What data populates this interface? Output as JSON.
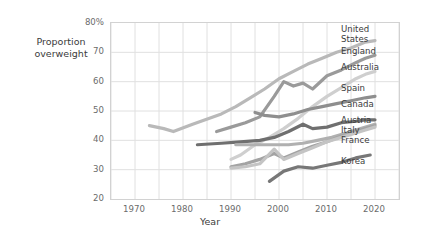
{
  "chart_data": {
    "type": "line",
    "title": "",
    "xlabel": "Year",
    "ylabel": "Proportion\noverweight",
    "xlim": [
      1965,
      2025
    ],
    "ylim": [
      20,
      80
    ],
    "xticks": [
      1970,
      1980,
      1990,
      2000,
      2010,
      2020
    ],
    "xtick_labels": [
      "1970",
      "1980",
      "1990",
      "2000",
      "2010",
      "2020"
    ],
    "yticks": [
      20,
      30,
      40,
      50,
      60,
      70,
      80
    ],
    "ytick_labels": [
      "20",
      "30",
      "40",
      "50",
      "60",
      "70",
      "80%"
    ],
    "grid": true,
    "grid_x_step": 5,
    "grid_y_step": 10,
    "legend_position": "right-inline",
    "series": [
      {
        "name": "United States",
        "label": "United\nStates",
        "color": "#b9b9b9",
        "x": [
          1973,
          1976,
          1978,
          1982,
          1988,
          1991,
          1994,
          1997,
          2000,
          2003,
          2006,
          2009,
          2012,
          2015,
          2018,
          2020
        ],
        "values": [
          45,
          44,
          43,
          45.5,
          49,
          51.5,
          54.5,
          57.5,
          61,
          63.5,
          66,
          68,
          70,
          71.5,
          73.5,
          74
        ]
      },
      {
        "name": "England",
        "label": "England",
        "color": "#9a9a9a",
        "x": [
          1987,
          1990,
          1993,
          1996,
          1999,
          2001,
          2003,
          2005,
          2007,
          2010,
          2013,
          2016,
          2018,
          2020
        ],
        "values": [
          43,
          44.5,
          46,
          48,
          55,
          60,
          58.5,
          59.5,
          57.5,
          62,
          64,
          66.5,
          68,
          69
        ]
      },
      {
        "name": "Australia",
        "label": "Australia",
        "color": "#cfcfcf",
        "x": [
          1990,
          1992,
          1995,
          1998,
          2001,
          2004,
          2007,
          2010,
          2013,
          2016,
          2018,
          2020
        ],
        "values": [
          33.5,
          35,
          38.5,
          41,
          44,
          47.5,
          51.5,
          55,
          58,
          61,
          62.5,
          63.5
        ]
      },
      {
        "name": "Spain",
        "label": "Spain",
        "color": "#8e8e8e",
        "x": [
          1995,
          1997,
          2000,
          2003,
          2006,
          2009,
          2012,
          2015,
          2018,
          2020
        ],
        "values": [
          49.5,
          48.5,
          48,
          49,
          50.5,
          51.5,
          52.5,
          53.5,
          54.5,
          55
        ]
      },
      {
        "name": "Canada",
        "label": "Canada",
        "color": "#6f6f6f",
        "x": [
          1983,
          1988,
          1992,
          1996,
          1999,
          2002,
          2005,
          2007,
          2010,
          2013,
          2016,
          2018,
          2020
        ],
        "values": [
          38.5,
          39,
          39.5,
          40,
          41,
          43,
          45.5,
          44,
          44.5,
          46,
          46.5,
          47,
          47
        ]
      },
      {
        "name": "Austria",
        "label": "Austria",
        "color": "#b0b0b0",
        "x": [
          1991,
          1994,
          1997,
          1999,
          2002,
          2005,
          2008,
          2011,
          2014,
          2017,
          2020
        ],
        "values": [
          38.5,
          38.5,
          38.5,
          38.5,
          38.5,
          39,
          40,
          41,
          42.5,
          44,
          45.5
        ]
      },
      {
        "name": "Italy",
        "label": "Italy",
        "color": "#a3a3a3",
        "x": [
          1990,
          1993,
          1996,
          1999,
          2001,
          2004,
          2007,
          2010,
          2013,
          2016,
          2018,
          2020
        ],
        "values": [
          31,
          32,
          33.5,
          35.5,
          34,
          36,
          38,
          39.5,
          41.5,
          43,
          44,
          45
        ]
      },
      {
        "name": "France",
        "label": "France",
        "color": "#c4c4c4",
        "x": [
          1990,
          1993,
          1996,
          1999,
          2001,
          2004,
          2007,
          2010,
          2013,
          2016,
          2018,
          2020
        ],
        "values": [
          30.5,
          31,
          32,
          37,
          33.5,
          35.5,
          37.5,
          39.5,
          41,
          42.5,
          43.5,
          44.5
        ]
      },
      {
        "name": "Korea",
        "label": "Korea",
        "color": "#777777",
        "x": [
          1998,
          2001,
          2004,
          2007,
          2010,
          2013,
          2016,
          2019
        ],
        "values": [
          26,
          29.5,
          31,
          30.5,
          31.5,
          32.5,
          34,
          35
        ]
      }
    ],
    "legend_entries": [
      {
        "label": "United\nStates",
        "top": 25
      },
      {
        "label": "England",
        "top": 47
      },
      {
        "label": "Australia",
        "top": 63
      },
      {
        "label": "Spain",
        "top": 84
      },
      {
        "label": "Canada",
        "top": 100
      },
      {
        "label": "Austria",
        "top": 116
      },
      {
        "label": "Italy",
        "top": 126
      },
      {
        "label": "France",
        "top": 136
      },
      {
        "label": "Korea",
        "top": 157
      }
    ]
  }
}
